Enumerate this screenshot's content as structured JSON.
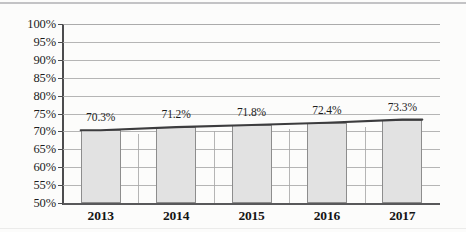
{
  "chart_data": {
    "type": "bar",
    "title": "",
    "subtitle": "",
    "xlabel": "",
    "ylabel": "",
    "categories": [
      "2013",
      "2014",
      "2015",
      "2016",
      "2017"
    ],
    "values": [
      70.3,
      71.2,
      71.8,
      72.4,
      73.3
    ],
    "data_labels": [
      "70.3%",
      "71.2%",
      "71.8%",
      "72.4%",
      "73.3%"
    ],
    "ylim": [
      50,
      100
    ],
    "ytick_step": 5,
    "ytick_labels": [
      "100%",
      "95%",
      "90%",
      "85%",
      "80%",
      "75%",
      "70%",
      "65%",
      "60%",
      "55%",
      "50%"
    ],
    "ytick_values": [
      100,
      95,
      90,
      85,
      80,
      75,
      70,
      65,
      60,
      55,
      50
    ],
    "grid": "horizontal-and-vertical",
    "legend": "none",
    "series": [
      {
        "name": "bars",
        "type": "bar",
        "values": [
          70.3,
          71.2,
          71.8,
          72.4,
          73.3
        ]
      },
      {
        "name": "trend",
        "type": "line",
        "values": [
          70.3,
          71.2,
          71.8,
          72.4,
          73.3
        ]
      }
    ],
    "colors": {
      "bar_fill": "#e2e2e2",
      "bar_border": "#8d8d8d",
      "trend_line": "#3c3c3e",
      "gridline": "#a8a8a8",
      "axis": "#4c4c4e",
      "text": "#1d1d1d",
      "background": "#fcfcfb"
    }
  }
}
